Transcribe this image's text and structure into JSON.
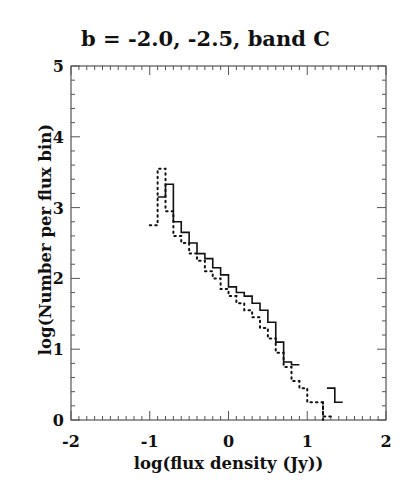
{
  "chart_data": {
    "type": "line",
    "style": "step-histogram",
    "title": "b = -2.0, -2.5, band C",
    "xlabel": "log(flux density (Jy))",
    "ylabel": "log(Number per flux bin)",
    "xlim": [
      -2,
      2
    ],
    "ylim": [
      0,
      5
    ],
    "xticks": [
      -2,
      -1,
      0,
      1,
      2
    ],
    "yticks": [
      0,
      1,
      2,
      3,
      4,
      5
    ],
    "grid": false,
    "legend": null,
    "series": [
      {
        "name": "solid",
        "line_style": "solid",
        "bin_width": 0.1,
        "bin_left_edges": [
          -0.9,
          -0.8,
          -0.7,
          -0.6,
          -0.5,
          -0.4,
          -0.3,
          -0.2,
          -0.1,
          0.0,
          0.1,
          0.2,
          0.3,
          0.4,
          0.5,
          0.6,
          0.7,
          0.8,
          1.25,
          1.35
        ],
        "values": [
          3.15,
          3.33,
          2.8,
          2.65,
          2.5,
          2.35,
          2.28,
          2.15,
          2.05,
          1.88,
          1.8,
          1.75,
          1.65,
          1.55,
          1.38,
          1.1,
          0.82,
          0.78,
          0.45,
          0.25
        ]
      },
      {
        "name": "dotted",
        "line_style": "dotted",
        "bin_width": 0.1,
        "bin_left_edges": [
          -1.0,
          -0.9,
          -0.8,
          -0.7,
          -0.6,
          -0.5,
          -0.4,
          -0.3,
          -0.2,
          -0.1,
          0.0,
          0.1,
          0.2,
          0.3,
          0.4,
          0.5,
          0.6,
          0.7,
          0.8,
          0.9,
          1.0,
          1.1,
          1.2
        ],
        "values": [
          2.75,
          3.55,
          2.95,
          2.6,
          2.5,
          2.35,
          2.25,
          2.1,
          2.0,
          1.85,
          1.75,
          1.65,
          1.55,
          1.45,
          1.3,
          1.15,
          0.95,
          0.75,
          0.55,
          0.45,
          0.25,
          0.25,
          0.05
        ]
      }
    ]
  }
}
